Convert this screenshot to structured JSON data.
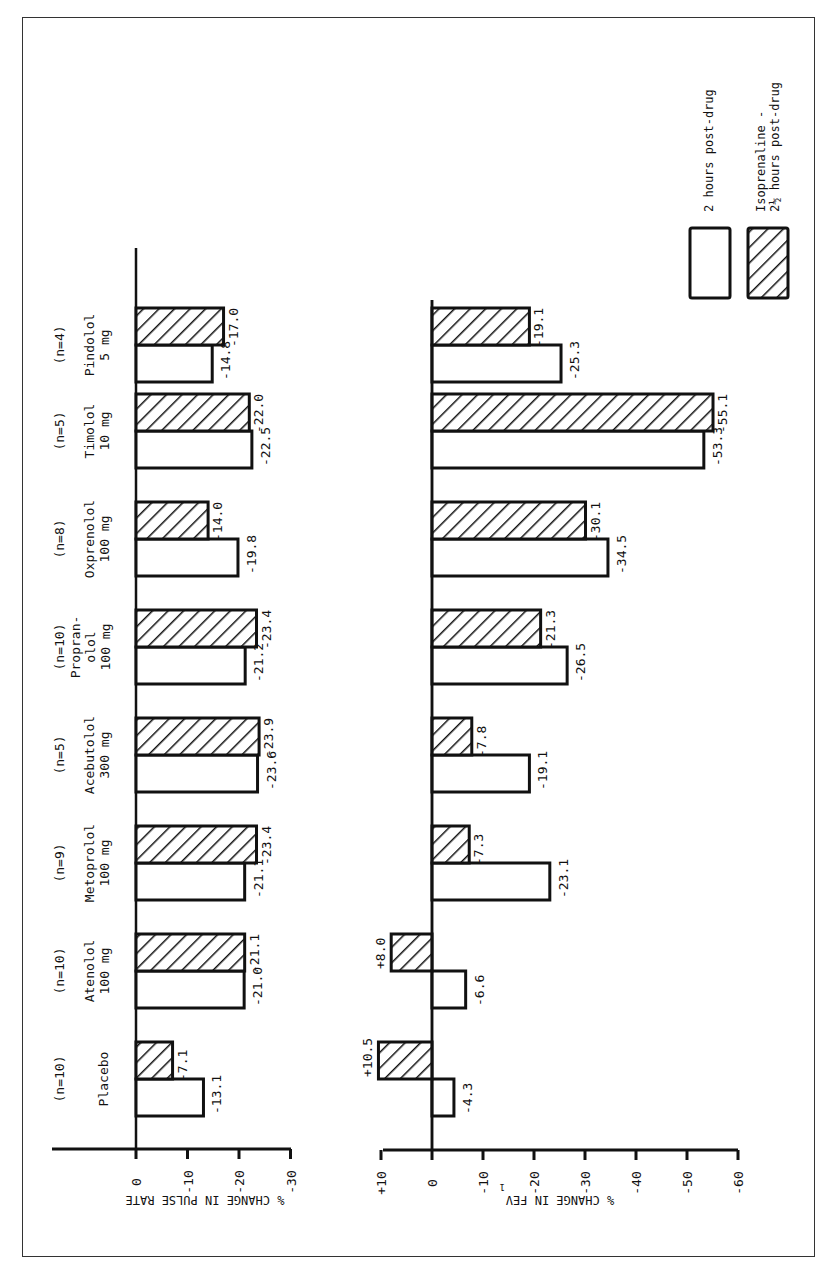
{
  "chart_data": [
    {
      "type": "bar",
      "orientation": "rotated-horizontal",
      "title": "",
      "xlabel": "",
      "ylabel": "% CHANGE IN PULSE RATE",
      "ylim": [
        0,
        -30
      ],
      "ticks": [
        "0",
        "-10",
        "-20",
        "-30"
      ],
      "tick_values": [
        0,
        -10,
        -20,
        -30
      ],
      "categories": [
        "Placebo",
        "Atenolol 100 mg",
        "Metoprolol 100 mg",
        "Acebutolol 300 mg",
        "Propranolol 100 mg",
        "Oxprenolol 100 mg",
        "Timolol 10 mg",
        "Pindolol 5 mg"
      ],
      "series": [
        {
          "name": "2 hours post-drug",
          "pattern": "open",
          "values": [
            -13.1,
            -21.0,
            -21.1,
            -23.6,
            -21.2,
            -19.8,
            -22.5,
            -14.8
          ]
        },
        {
          "name": "Isoprenaline - 2½ hours post-drug",
          "pattern": "hatched",
          "values": [
            -7.1,
            -21.1,
            -23.4,
            -23.9,
            -23.4,
            -14.0,
            -22.0,
            -17.0
          ]
        }
      ],
      "data_labels": {
        "open": [
          "-13.1",
          "-21.0",
          "-21.1",
          "-23.6",
          "-21.2",
          "-19.8",
          "-22.5",
          "-14.8"
        ],
        "hatched": [
          "-7.1",
          "-21.1",
          "-23.4",
          "-23.9",
          "-23.4",
          "-14.0",
          "-22.0",
          "-17.0"
        ]
      },
      "grid": false
    },
    {
      "type": "bar",
      "orientation": "rotated-horizontal",
      "title": "",
      "xlabel": "",
      "ylabel": "% CHANGE IN FEV1",
      "ylim": [
        10,
        -60
      ],
      "ticks": [
        "+10",
        "0",
        "-10",
        "-20",
        "-30",
        "-40",
        "-50",
        "-60"
      ],
      "tick_values": [
        10,
        0,
        -10,
        -20,
        -30,
        -40,
        -50,
        -60
      ],
      "categories": [
        "Placebo",
        "Atenolol 100 mg",
        "Metoprolol 100 mg",
        "Acebutolol 300 mg",
        "Propranolol 100 mg",
        "Oxprenolol 100 mg",
        "Timolol 10 mg",
        "Pindolol 5 mg"
      ],
      "series": [
        {
          "name": "2 hours post-drug",
          "pattern": "open",
          "values": [
            -4.3,
            -6.6,
            -23.1,
            -19.1,
            -26.5,
            -34.5,
            -53.3,
            -25.3
          ]
        },
        {
          "name": "Isoprenaline - 2½ hours post-drug",
          "pattern": "hatched",
          "values": [
            10.5,
            8.0,
            -7.3,
            -7.8,
            -21.3,
            -30.1,
            -55.1,
            -19.1
          ]
        }
      ],
      "data_labels": {
        "open": [
          "-4.3",
          "-6.6",
          "-23.1",
          "-19.1",
          "-26.5",
          "-34.5",
          "-53.3",
          "-25.3"
        ],
        "hatched": [
          "+10.5",
          "+8.0",
          "-7.3",
          "-7.8",
          "-21.3",
          "-30.1",
          "-55.1",
          "-19.1"
        ]
      },
      "grid": false
    }
  ],
  "groups": [
    {
      "n": "(n=10)",
      "drug_lines": [
        "Placebo"
      ]
    },
    {
      "n": "(n=10)",
      "drug_lines": [
        "Atenolol",
        "100 mg"
      ]
    },
    {
      "n": "(n=9)",
      "drug_lines": [
        "Metoprolol",
        "100 mg"
      ]
    },
    {
      "n": "(n=5)",
      "drug_lines": [
        "Acebutolol",
        "300 mg"
      ]
    },
    {
      "n": "(n=10)",
      "drug_lines": [
        "Propran-",
        "olol",
        "100 mg"
      ]
    },
    {
      "n": "(n=8)",
      "drug_lines": [
        "Oxprenolol",
        "100 mg"
      ]
    },
    {
      "n": "(n=5)",
      "drug_lines": [
        "Timolol",
        "10 mg"
      ]
    },
    {
      "n": "(n=4)",
      "drug_lines": [
        "Pindolol",
        "5 mg"
      ]
    }
  ],
  "axis_titles": {
    "pulse": "% CHANGE IN PULSE RATE",
    "fev_main": "% CHANGE IN FEV",
    "fev_sub": "1"
  },
  "legend": {
    "placement": "top-right",
    "items": [
      {
        "pattern": "open",
        "lines": [
          "2 hours post-drug"
        ]
      },
      {
        "pattern": "hatched",
        "lines": [
          "Isoprenaline -",
          "2½ hours post-drug"
        ]
      }
    ]
  },
  "colors": {
    "ink": "#111111",
    "paper": "#ffffff"
  }
}
